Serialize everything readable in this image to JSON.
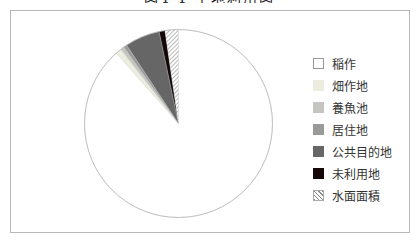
{
  "title": "図4-1 土地利用図",
  "chart_data": {
    "type": "pie",
    "title": "図4-1 土地利用図",
    "start_angle_deg": 0,
    "direction": "counterclockwise",
    "legend_position": "right",
    "slices": [
      {
        "label": "稲作",
        "value": 88.5,
        "color": "#ffffff",
        "pattern": "none"
      },
      {
        "label": "畑作地",
        "value": 1.0,
        "color": "#ececdf",
        "pattern": "none"
      },
      {
        "label": "養魚池",
        "value": 0.6,
        "color": "#c4c4c0",
        "pattern": "none"
      },
      {
        "label": "居住地",
        "value": 0.6,
        "color": "#9a9a98",
        "pattern": "none"
      },
      {
        "label": "公共目的地",
        "value": 6.0,
        "color": "#666666",
        "pattern": "none"
      },
      {
        "label": "未利用地",
        "value": 1.0,
        "color": "#140808",
        "pattern": "none"
      },
      {
        "label": "水面面積",
        "value": 2.3,
        "color": "#ffffff",
        "pattern": "diagonal-hatch"
      }
    ]
  },
  "legend": {
    "items": [
      {
        "label": "稲作",
        "color": "#ffffff",
        "pattern": "none"
      },
      {
        "label": "畑作地",
        "color": "#ececdf",
        "pattern": "none"
      },
      {
        "label": "養魚池",
        "color": "#c4c4c0",
        "pattern": "none"
      },
      {
        "label": "居住地",
        "color": "#9a9a98",
        "pattern": "none"
      },
      {
        "label": "公共目的地",
        "color": "#666666",
        "pattern": "none"
      },
      {
        "label": "未利用地",
        "color": "#140808",
        "pattern": "none"
      },
      {
        "label": "水面面積",
        "color": "#ffffff",
        "pattern": "diagonal-hatch"
      }
    ]
  }
}
